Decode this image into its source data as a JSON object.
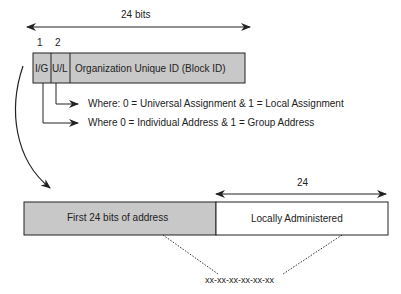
{
  "top_frame": {
    "width_label": "24 bits",
    "bit_numbers": [
      "1",
      "2"
    ],
    "fields": [
      "I/G",
      "U/L",
      "Organization Unique ID (Block ID)"
    ]
  },
  "notes": {
    "ul_note": "Where: 0 = Universal Assignment & 1 = Local Assignment",
    "ig_note": "Where 0 = Individual Address & 1 = Group Address"
  },
  "bottom_frame": {
    "width_label": "24",
    "fields": [
      "First 24 bits of address",
      "Locally Administered"
    ],
    "address_format": "xx-xx-xx-xx-xx-xx"
  },
  "colors": {
    "gray_fill": "#c8c8c8",
    "stroke": "#222222"
  }
}
